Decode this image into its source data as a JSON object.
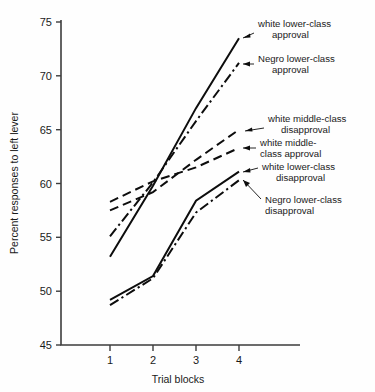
{
  "chart_data": {
    "type": "line",
    "title": "",
    "xlabel": "Trial blocks",
    "ylabel": "Percent responses to left lever",
    "x": [
      1,
      2,
      3,
      4
    ],
    "xticklabels": [
      "1",
      "2",
      "3",
      "4"
    ],
    "yticks": [
      45,
      50,
      55,
      60,
      65,
      70,
      75
    ],
    "yticklabels": [
      "45",
      "50",
      "55",
      "60",
      "65",
      "70",
      "75"
    ],
    "ylim": [
      45,
      75
    ],
    "xlim": [
      0.5,
      4.5
    ],
    "grid": false,
    "legend_position": "right-inline-annotations",
    "series": [
      {
        "name": "white lower-class approval",
        "style": "solid",
        "values": [
          53.2,
          59.8,
          67.0,
          73.5
        ]
      },
      {
        "name": "Negro lower-class approval",
        "style": "dash-dot",
        "values": [
          55.1,
          60.1,
          65.8,
          71.2
        ]
      },
      {
        "name": "white middle-class disapproval",
        "style": "dashed",
        "values": [
          57.5,
          59.2,
          62.2,
          65.0
        ]
      },
      {
        "name": "white middle-class approval",
        "style": "dashed",
        "values": [
          58.3,
          60.2,
          61.5,
          63.3
        ]
      },
      {
        "name": "white lower-class disapproval",
        "style": "solid",
        "values": [
          49.2,
          51.4,
          58.4,
          61.1
        ]
      },
      {
        "name": "Negro lower-class disapproval",
        "style": "dash-dot",
        "values": [
          48.7,
          51.2,
          57.3,
          60.3
        ]
      }
    ],
    "annotations": [
      {
        "label_line1": "white lower-class",
        "label_line2": "approval"
      },
      {
        "label_line1": "Negro lower-class",
        "label_line2": "approval"
      },
      {
        "label_line1": "white middle-class",
        "label_line2": "disapproval"
      },
      {
        "label_line1": "white middle-",
        "label_line2": "class approval"
      },
      {
        "label_line1": "white lower-class",
        "label_line2": "disapproval"
      },
      {
        "label_line1": "Negro lower-class",
        "label_line2": "disapproval"
      }
    ],
    "colors": {
      "line": "#0d0d0d",
      "axis": "#3d3d3d",
      "text": "#1a1a1a",
      "background": "#fefefe"
    }
  }
}
